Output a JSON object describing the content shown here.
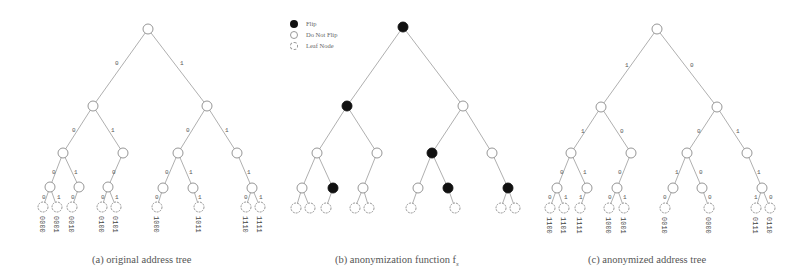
{
  "figure": {
    "legend": {
      "flip": "Flip",
      "no_flip": "Do Not Flip",
      "leaf": "Leaf Node"
    },
    "captions": {
      "a": "(a) original address tree",
      "b": "(b) anonymization function f",
      "b_sub": "s",
      "c": "(c) anonymized address tree"
    },
    "colors": {
      "flip_node": "#111111",
      "edge": "#9a9a9a",
      "node_outline": "#8a8a8a"
    },
    "tree_a": {
      "edge_label_root_left": "0",
      "edge_label_root_right": "1",
      "leaves": [
        "0000",
        "0001",
        "0010",
        "0100",
        "0101",
        "1000",
        "1011",
        "1110",
        "1111"
      ]
    },
    "tree_c": {
      "edge_label_root_left": "1",
      "edge_label_root_right": "0",
      "leaves": [
        "1100",
        "1101",
        "1111",
        "1000",
        "1001",
        "0010",
        "0000",
        "0111",
        "0110"
      ]
    }
  }
}
